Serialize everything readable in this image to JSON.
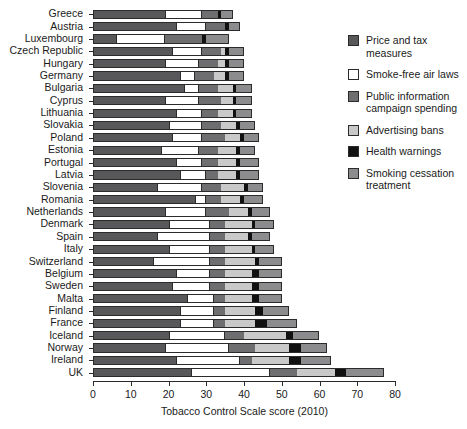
{
  "chart_data": {
    "type": "bar",
    "orientation": "horizontal",
    "stacked": true,
    "title": "",
    "xlabel": "Tobacco Control Scale score (2010)",
    "ylabel": "",
    "xlim": [
      0,
      80
    ],
    "xticks": [
      0,
      10,
      20,
      30,
      40,
      50,
      60,
      70,
      80
    ],
    "grid": false,
    "legend_position": "right",
    "categories": [
      "Greece",
      "Austria",
      "Luxembourg",
      "Czech Republic",
      "Hungary",
      "Germany",
      "Bulgaria",
      "Cyprus",
      "Lithuania",
      "Slovakia",
      "Poland",
      "Estonia",
      "Portugal",
      "Latvia",
      "Slovenia",
      "Romania",
      "Netherlands",
      "Denmark",
      "Spain",
      "Italy",
      "Switzerland",
      "Belgium",
      "Sweden",
      "Malta",
      "Finland",
      "France",
      "Iceland",
      "Norway",
      "Ireland",
      "UK"
    ],
    "series": [
      {
        "name": "Price and tax measures",
        "color": "#58585a",
        "values": [
          19,
          22,
          6,
          21,
          19,
          23,
          24,
          19,
          22,
          20,
          21,
          18,
          22,
          23,
          17,
          27,
          19,
          20,
          17,
          20,
          16,
          22,
          21,
          25,
          23,
          23,
          20,
          19,
          22,
          26
        ]
      },
      {
        "name": "Smoke-free air laws",
        "color": "#ffffff",
        "values": [
          10,
          8,
          13,
          8,
          9,
          4,
          4,
          9,
          7,
          9,
          8,
          10,
          7,
          7,
          12,
          3,
          11,
          11,
          14,
          11,
          15,
          9,
          10,
          7,
          9,
          9,
          15,
          17,
          17,
          21
        ]
      },
      {
        "name": "Public information campaign spending",
        "color": "#6e6e70",
        "values": [
          4,
          5,
          10,
          5,
          5,
          5,
          5,
          6,
          4,
          5,
          6,
          5,
          4,
          3,
          5,
          4,
          6,
          4,
          4,
          4,
          4,
          4,
          4,
          3,
          3,
          3,
          5,
          7,
          3,
          7
        ]
      },
      {
        "name": "Advertising bans",
        "color": "#c9c9c9",
        "values": [
          0,
          0,
          0,
          1,
          2,
          3,
          4,
          3,
          4,
          4,
          4,
          5,
          5,
          5,
          6,
          5,
          5,
          7,
          6,
          7,
          8,
          7,
          7,
          7,
          8,
          8,
          11,
          9,
          10,
          10
        ]
      },
      {
        "name": "Health warnings",
        "color": "#111111",
        "values": [
          1,
          1,
          1,
          1,
          1,
          1,
          1,
          1,
          1,
          1,
          1,
          1,
          1,
          1,
          1,
          1,
          1,
          1,
          1,
          1,
          1,
          2,
          2,
          2,
          2,
          3,
          2,
          3,
          3,
          3
        ]
      },
      {
        "name": "Smoking cessation treatment",
        "color": "#8c8c8e",
        "values": [
          3,
          3,
          6,
          4,
          4,
          4,
          4,
          4,
          4,
          4,
          4,
          4,
          5,
          5,
          4,
          5,
          5,
          5,
          5,
          5,
          6,
          6,
          6,
          6,
          7,
          8,
          7,
          7,
          8,
          10
        ]
      }
    ]
  },
  "axis": {
    "x_title": "Tobacco Control Scale score (2010)",
    "x_tick_labels": [
      "0",
      "10",
      "20",
      "30",
      "40",
      "50",
      "60",
      "70",
      "80"
    ]
  },
  "legend": {
    "items": [
      {
        "label": "Price and tax measures",
        "swatch": "#58585a"
      },
      {
        "label": "Smoke-free air laws",
        "swatch": "#ffffff"
      },
      {
        "label": "Public information campaign spending",
        "swatch": "#6e6e70"
      },
      {
        "label": "Advertising bans",
        "swatch": "#c9c9c9"
      },
      {
        "label": "Health warnings",
        "swatch": "#111111"
      },
      {
        "label": "Smoking cessation treatment",
        "swatch": "#8c8c8e"
      }
    ]
  }
}
